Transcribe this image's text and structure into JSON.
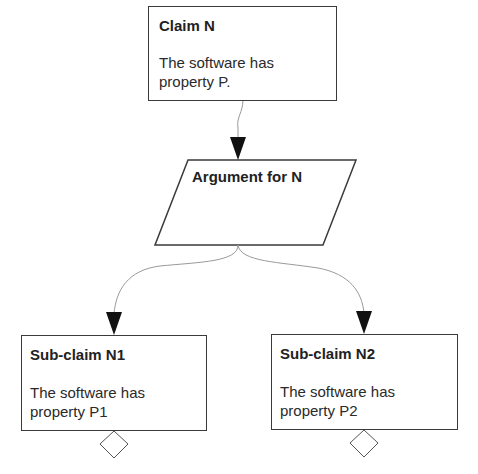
{
  "diagram": {
    "type": "argument-tree",
    "nodes": {
      "claim": {
        "title": "Claim N",
        "body_line1": "The software has",
        "body_line2": "property P.",
        "shape": "rectangle"
      },
      "argument": {
        "title": "Argument for N",
        "shape": "parallelogram"
      },
      "subclaim1": {
        "title": "Sub-claim N1",
        "body_line1": "The software has",
        "body_line2": "property P1",
        "shape": "rectangle"
      },
      "subclaim2": {
        "title": "Sub-claim N2",
        "body_line1": "The software has",
        "body_line2": "property P2",
        "shape": "rectangle"
      }
    },
    "edges": [
      {
        "from": "claim",
        "to": "argument",
        "arrow": "filled-triangle"
      },
      {
        "from": "argument",
        "to": "subclaim1",
        "arrow": "filled-triangle"
      },
      {
        "from": "argument",
        "to": "subclaim2",
        "arrow": "filled-triangle"
      }
    ],
    "decorations": [
      {
        "attached_to": "subclaim1",
        "icon": "diamond-icon",
        "position": "bottom-center"
      },
      {
        "attached_to": "subclaim2",
        "icon": "diamond-icon",
        "position": "bottom-center"
      }
    ],
    "colors": {
      "node_border": "#3a3a3a",
      "connector": "#9a9a9a",
      "arrowhead": "#111111",
      "background": "#ffffff"
    }
  }
}
